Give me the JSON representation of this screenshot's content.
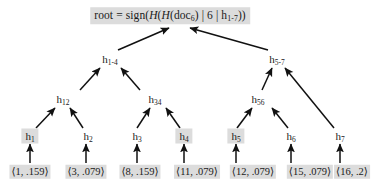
{
  "diagram": {
    "type": "merkle-hash-tree",
    "title_text": "root = sign(H(H(doc6) | 6 | h1-7))",
    "background": "#ffffff",
    "highlight_color": "#dcdcdc",
    "edge_color": "#111111"
  },
  "root": {
    "name": "root-node",
    "prefix": "root = sign(",
    "h_outer": "H",
    "open1": "(",
    "h_inner": "H",
    "open2": "(doc",
    "doc_sub": "6",
    "close_doc": ")",
    "sep1": " | ",
    "index": "6",
    "sep2": " | ",
    "h_leaf": "h",
    "h_leaf_sub": "1-7",
    "close_tail": "))",
    "highlighted": true,
    "x": 170,
    "y": 16
  },
  "inner_nodes": [
    {
      "name": "node-h1-4",
      "base": "h",
      "sub": "1-4",
      "highlighted": false,
      "x": 110,
      "y": 59
    },
    {
      "name": "node-h5-7",
      "base": "h",
      "sub": "5-7",
      "highlighted": false,
      "x": 277,
      "y": 59
    },
    {
      "name": "node-h12",
      "base": "h",
      "sub": "12",
      "highlighted": false,
      "x": 63,
      "y": 99
    },
    {
      "name": "node-h34",
      "base": "h",
      "sub": "34",
      "highlighted": false,
      "x": 155,
      "y": 99
    },
    {
      "name": "node-h56",
      "base": "h",
      "sub": "56",
      "highlighted": false,
      "x": 258,
      "y": 99
    }
  ],
  "leaf_nodes": [
    {
      "name": "leaf-h1",
      "base": "h",
      "sub": "1",
      "highlighted": true,
      "x": 30,
      "y": 136
    },
    {
      "name": "leaf-h2",
      "base": "h",
      "sub": "2",
      "highlighted": false,
      "x": 88,
      "y": 136
    },
    {
      "name": "leaf-h3",
      "base": "h",
      "sub": "3",
      "highlighted": false,
      "x": 137,
      "y": 136
    },
    {
      "name": "leaf-h4",
      "base": "h",
      "sub": "4",
      "highlighted": true,
      "x": 184,
      "y": 136
    },
    {
      "name": "leaf-h5",
      "base": "h",
      "sub": "5",
      "highlighted": true,
      "x": 236,
      "y": 136
    },
    {
      "name": "leaf-h6",
      "base": "h",
      "sub": "6",
      "highlighted": false,
      "x": 291,
      "y": 136
    },
    {
      "name": "leaf-h7",
      "base": "h",
      "sub": "7",
      "highlighted": false,
      "x": 340,
      "y": 136
    }
  ],
  "tuples": [
    {
      "name": "tuple-1",
      "text": "⟨1, .159⟩",
      "highlighted": true,
      "x": 30,
      "y": 172
    },
    {
      "name": "tuple-2",
      "text": "⟨3, .079⟩",
      "highlighted": true,
      "x": 86,
      "y": 172
    },
    {
      "name": "tuple-3",
      "text": "⟨8, .159⟩",
      "highlighted": true,
      "x": 140,
      "y": 172
    },
    {
      "name": "tuple-4",
      "text": "⟨11, .079⟩",
      "highlighted": true,
      "x": 197,
      "y": 172
    },
    {
      "name": "tuple-5",
      "text": "⟨12, .079⟩",
      "highlighted": true,
      "x": 253,
      "y": 172
    },
    {
      "name": "tuple-6",
      "text": "⟨15, .079⟩",
      "highlighted": true,
      "x": 310,
      "y": 172
    },
    {
      "name": "tuple-7",
      "text": "⟨16, .2⟩",
      "highlighted": true,
      "x": 352,
      "y": 172
    }
  ],
  "edges": [
    {
      "name": "edge-h1-4-to-root",
      "from": "h1-4",
      "to": "root",
      "x1": 118,
      "y1": 50,
      "x2": 169,
      "y2": 28
    },
    {
      "name": "edge-h5-7-to-root",
      "from": "h5-7",
      "to": "root",
      "x1": 268,
      "y1": 50,
      "x2": 190,
      "y2": 28
    },
    {
      "name": "edge-h12-to-h1-4",
      "from": "h12",
      "to": "h1-4",
      "x1": 80,
      "y1": 90,
      "x2": 100,
      "y2": 68
    },
    {
      "name": "edge-h34-to-h1-4",
      "from": "h34",
      "to": "h1-4",
      "x1": 140,
      "y1": 90,
      "x2": 121,
      "y2": 68
    },
    {
      "name": "edge-h56-to-h5-7",
      "from": "h56",
      "to": "h5-7",
      "x1": 262,
      "y1": 90,
      "x2": 272,
      "y2": 68
    },
    {
      "name": "edge-h7-to-h5-7",
      "from": "h7",
      "to": "h5-7",
      "x1": 334,
      "y1": 128,
      "x2": 285,
      "y2": 68
    },
    {
      "name": "edge-h1-to-h12",
      "from": "h1",
      "to": "h12",
      "x1": 36,
      "y1": 128,
      "x2": 55,
      "y2": 108
    },
    {
      "name": "edge-h2-to-h12",
      "from": "h2",
      "to": "h12",
      "x1": 83,
      "y1": 128,
      "x2": 70,
      "y2": 108
    },
    {
      "name": "edge-h3-to-h34",
      "from": "h3",
      "to": "h34",
      "x1": 137,
      "y1": 128,
      "x2": 150,
      "y2": 108
    },
    {
      "name": "edge-h4-to-h34",
      "from": "h4",
      "to": "h34",
      "x1": 180,
      "y1": 128,
      "x2": 166,
      "y2": 108
    },
    {
      "name": "edge-h5-to-h56",
      "from": "h5",
      "to": "h56",
      "x1": 237,
      "y1": 128,
      "x2": 252,
      "y2": 108
    },
    {
      "name": "edge-h6-to-h56",
      "from": "h6",
      "to": "h56",
      "x1": 288,
      "y1": 128,
      "x2": 272,
      "y2": 108
    },
    {
      "name": "edge-tuple1-to-h1",
      "from": "tuple-1",
      "to": "h1",
      "x1": 30,
      "y1": 163,
      "x2": 30,
      "y2": 144
    },
    {
      "name": "edge-tuple2-to-h2",
      "from": "tuple-2",
      "to": "h2",
      "x1": 86,
      "y1": 163,
      "x2": 86,
      "y2": 144
    },
    {
      "name": "edge-tuple3-to-h3",
      "from": "tuple-3",
      "to": "h3",
      "x1": 137,
      "y1": 163,
      "x2": 137,
      "y2": 144
    },
    {
      "name": "edge-tuple4-to-h4",
      "from": "tuple-4",
      "to": "h4",
      "x1": 184,
      "y1": 163,
      "x2": 184,
      "y2": 144
    },
    {
      "name": "edge-tuple5-to-h5",
      "from": "tuple-5",
      "to": "h5",
      "x1": 236,
      "y1": 163,
      "x2": 236,
      "y2": 144
    },
    {
      "name": "edge-tuple6-to-h6",
      "from": "tuple-6",
      "to": "h6",
      "x1": 291,
      "y1": 163,
      "x2": 291,
      "y2": 144
    },
    {
      "name": "edge-tuple7-to-h7",
      "from": "tuple-7",
      "to": "h7",
      "x1": 340,
      "y1": 163,
      "x2": 340,
      "y2": 144
    }
  ]
}
